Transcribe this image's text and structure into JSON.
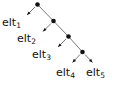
{
  "diagram": {
    "background_color": "#ffffff",
    "line_color": "#6b6b6b",
    "node_color": "#111111",
    "text_color": "#111111",
    "node_radius": 2.3,
    "spine": {
      "name": "cons-cell-spine",
      "nodes": [
        {
          "id": "node1",
          "x": 37.5,
          "y": 4.5
        },
        {
          "id": "node2",
          "x": 53.5,
          "y": 21.0
        },
        {
          "id": "node3",
          "x": 68.5,
          "y": 36.5
        },
        {
          "id": "node4",
          "x": 82.5,
          "y": 52.0
        }
      ],
      "segments": [
        {
          "from": "node1",
          "to": "node2"
        },
        {
          "from": "node2",
          "to": "node3"
        },
        {
          "from": "node3",
          "to": "node4"
        }
      ]
    },
    "arrows": [
      {
        "id": "arrow1",
        "from_node": "node1",
        "x1": 35.0,
        "y1": 7.0,
        "x2": 27.0,
        "y2": 15.0,
        "target_label": "elt1"
      },
      {
        "id": "arrow2",
        "from_node": "node2",
        "x1": 51.0,
        "y1": 23.5,
        "x2": 43.0,
        "y2": 31.5,
        "target_label": "elt2"
      },
      {
        "id": "arrow3",
        "from_node": "node3",
        "x1": 66.0,
        "y1": 39.0,
        "x2": 58.0,
        "y2": 47.0,
        "target_label": "elt3"
      },
      {
        "id": "arrow4",
        "from_node": "node4",
        "x1": 80.0,
        "y1": 54.5,
        "x2": 72.5,
        "y2": 62.5,
        "target_label": "elt4"
      },
      {
        "id": "arrow5",
        "from_node": "node4",
        "x1": 85.0,
        "y1": 54.5,
        "x2": 92.5,
        "y2": 62.5,
        "target_label": "elt5"
      }
    ],
    "labels": [
      {
        "id": "elt1",
        "base": "elt",
        "subscript": "1",
        "x": 2.0,
        "y": 26.0
      },
      {
        "id": "elt2",
        "base": "elt",
        "subscript": "2",
        "x": 17.0,
        "y": 42.0
      },
      {
        "id": "elt3",
        "base": "elt",
        "subscript": "3",
        "x": 32.0,
        "y": 57.5
      },
      {
        "id": "elt4",
        "base": "elt",
        "subscript": "4",
        "x": 56.0,
        "y": 76.0
      },
      {
        "id": "elt5",
        "base": "elt",
        "subscript": "5",
        "x": 86.0,
        "y": 76.0
      }
    ]
  }
}
